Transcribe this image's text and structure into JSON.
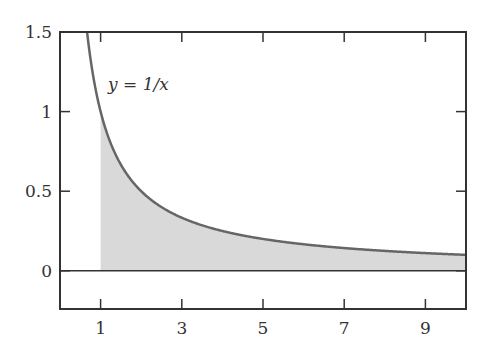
{
  "chart_data": {
    "type": "area",
    "title": "",
    "xlabel": "",
    "ylabel": "",
    "xlim": [
      0,
      10
    ],
    "ylim": [
      -0.24,
      1.5
    ],
    "grid": false,
    "x_ticks": [
      1,
      3,
      5,
      7,
      9
    ],
    "x_tick_labels": [
      "1",
      "3",
      "5",
      "7",
      "9"
    ],
    "y_ticks": [
      0,
      0.5,
      1,
      1.5
    ],
    "y_tick_labels": [
      "0",
      "0.5",
      "1",
      "1.5"
    ],
    "series": [
      {
        "name": "y = 1/x",
        "function": "1/x",
        "x": [
          0.667,
          1,
          1.5,
          2,
          3,
          4,
          5,
          6,
          7,
          8,
          9,
          10
        ],
        "values": [
          1.5,
          1,
          0.667,
          0.5,
          0.333,
          0.25,
          0.2,
          0.167,
          0.143,
          0.125,
          0.111,
          0.1
        ]
      }
    ],
    "shaded_region": {
      "from_x": 1,
      "to_x": 10,
      "between": [
        "y=0",
        "y=1/x"
      ]
    },
    "annotations": [
      {
        "text": "y = 1/x",
        "x": 1.5,
        "y": 1.25
      }
    ],
    "colors": {
      "curve": "#666666",
      "fill": "#d9d9d9",
      "axes": "#333333"
    }
  },
  "labels": {
    "curve_label": "y = 1/x"
  }
}
